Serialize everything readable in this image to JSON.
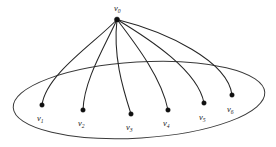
{
  "figure": {
    "background_color": "#ffffff",
    "stroke_color": "#262626",
    "region_stroke_color": "#3a3a3a",
    "vertex_color": "#101010",
    "width": 276,
    "height": 147
  },
  "region": {
    "name": "enclosing-ellipse",
    "shape": "ellipse",
    "center_x": 139,
    "center_y": 100,
    "radius_x": 126,
    "radius_y": 38,
    "rotation_deg": -3.5
  },
  "apex": {
    "id": "v0",
    "label_base": "v",
    "label_sub": "0",
    "x": 117,
    "y": 19.5,
    "label_x": 114,
    "label_y": 11,
    "dot_radius": 2.6
  },
  "vertices": [
    {
      "id": "v1",
      "label_base": "v",
      "label_sub": "1",
      "x": 42,
      "y": 105,
      "label_x": 37,
      "label_y": 121,
      "dot_radius": 2.3,
      "edge_control_1_x": 96,
      "edge_control_1_y": 42,
      "edge_control_2_x": 46,
      "edge_control_2_y": 74
    },
    {
      "id": "v2",
      "label_base": "v",
      "label_sub": "2",
      "x": 83,
      "y": 110,
      "label_x": 78,
      "label_y": 126,
      "dot_radius": 2.3,
      "edge_control_1_x": 104,
      "edge_control_1_y": 48,
      "edge_control_2_x": 84,
      "edge_control_2_y": 80
    },
    {
      "id": "v3",
      "label_base": "v",
      "label_sub": "3",
      "x": 131,
      "y": 114,
      "label_x": 126,
      "label_y": 130,
      "dot_radius": 2.3,
      "edge_control_1_x": 113,
      "edge_control_1_y": 55,
      "edge_control_2_x": 122,
      "edge_control_2_y": 86
    },
    {
      "id": "v4",
      "label_base": "v",
      "label_sub": "4",
      "x": 168,
      "y": 110,
      "label_x": 163,
      "label_y": 126,
      "dot_radius": 2.3,
      "edge_control_1_x": 138,
      "edge_control_1_y": 47,
      "edge_control_2_x": 162,
      "edge_control_2_y": 79
    },
    {
      "id": "v5",
      "label_base": "v",
      "label_sub": "5",
      "x": 204,
      "y": 103,
      "label_x": 199,
      "label_y": 120,
      "dot_radius": 2.3,
      "edge_control_1_x": 151,
      "edge_control_1_y": 40,
      "edge_control_2_x": 198,
      "edge_control_2_y": 71
    },
    {
      "id": "v6",
      "label_base": "v",
      "label_sub": "6",
      "x": 232,
      "y": 95,
      "label_x": 227,
      "label_y": 112,
      "dot_radius": 2.3,
      "edge_control_1_x": 167,
      "edge_control_1_y": 32,
      "edge_control_2_x": 228,
      "edge_control_2_y": 61
    }
  ]
}
